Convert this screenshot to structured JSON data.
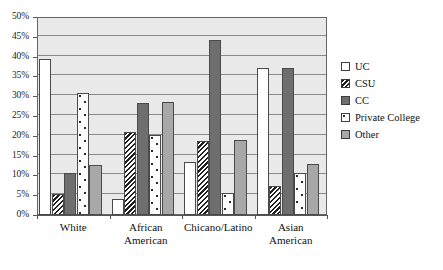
{
  "chart_data": {
    "type": "bar",
    "title": "",
    "subtitle": "",
    "xlabel": "",
    "ylabel": "",
    "ylim": [
      0,
      50
    ],
    "ytick_labels": [
      "0%",
      "5%",
      "10%",
      "15%",
      "20%",
      "25%",
      "30%",
      "35%",
      "40%",
      "45%",
      "50%"
    ],
    "ytick_values": [
      0,
      5,
      10,
      15,
      20,
      25,
      30,
      35,
      40,
      45,
      50
    ],
    "grid": true,
    "legend_position": "right",
    "categories": [
      "White",
      "African\nAmerican",
      "Chicano/Latino",
      "Asian\nAmerican"
    ],
    "series": [
      {
        "name": "UC",
        "values": [
          39.5,
          4.0,
          13.5,
          37.0
        ],
        "color": "#ffffff",
        "pattern": "solid-white"
      },
      {
        "name": "CSU",
        "values": [
          5.2,
          21.0,
          18.8,
          7.3
        ],
        "color": "#202020",
        "pattern": "zigzag-hatch"
      },
      {
        "name": "CC",
        "values": [
          10.7,
          28.3,
          44.2,
          37.2
        ],
        "color": "#6e6e6e",
        "pattern": "solid-dark-gray"
      },
      {
        "name": "Private College",
        "values": [
          30.8,
          20.2,
          5.5,
          10.5
        ],
        "color": "#fdfdfd",
        "pattern": "white-dotted"
      },
      {
        "name": "Other",
        "values": [
          12.6,
          28.5,
          19.0,
          13.0
        ],
        "color": "#a8a8a8",
        "pattern": "solid-mid-gray"
      }
    ]
  },
  "legend": {
    "items": [
      {
        "label": "UC"
      },
      {
        "label": "CSU"
      },
      {
        "label": "CC"
      },
      {
        "label": "Private College"
      },
      {
        "label": "Other"
      }
    ]
  },
  "colors": {
    "plot_background": "#e9e9e9",
    "gridline": "#8a8a8a",
    "axis": "#555555",
    "bar_border": "#4a4a4a",
    "text": "#111111"
  }
}
